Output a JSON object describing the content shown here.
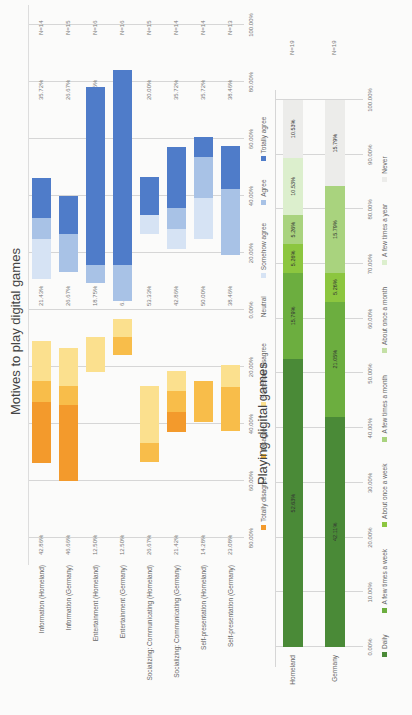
{
  "chart_data": [
    {
      "type": "bar",
      "subtype": "diverging-stacked-horizontal",
      "title": "Motives to play digital games",
      "categories": [
        "Information (Homeland)",
        "Information (Germany)",
        "Entertainment (Homeland)",
        "Entertainment (Germany)",
        "Socializing: Communicating (Homeland)",
        "Socializing: Communicating (Germany)",
        "Self-presentation (Homeland)",
        "Self-presentation (Germany)"
      ],
      "n": [
        "N=14",
        "N=15",
        "N=16",
        "N=16",
        "N=15",
        "N=14",
        "N=14",
        "N=13"
      ],
      "left_totals": [
        "42.86%",
        "46.66%",
        "12.50%",
        "12.50%",
        "26.67%",
        "21.42%",
        "14.28%",
        "23.08%"
      ],
      "neutral_values": [
        "21.43%",
        "26.67%",
        "18.75%",
        "6.25%",
        "53.33%",
        "42.86%",
        "50.00%",
        "38.46%"
      ],
      "right_totals": [
        "35.72%",
        "26.67%",
        "68.75%",
        "81.25%",
        "20.00%",
        "35.72%",
        "35.72%",
        "38.46%"
      ],
      "series": [
        {
          "name": "Totally disagree",
          "color": "#f39a2c",
          "values": [
            21.43,
            26.67,
            0,
            0,
            0,
            7.14,
            0,
            0
          ]
        },
        {
          "name": "Disagree",
          "color": "#f8bd4a",
          "values": [
            7.14,
            6.67,
            0,
            6.25,
            6.67,
            7.14,
            14.28,
            15.39
          ]
        },
        {
          "name": "Somehow disagree",
          "color": "#fbe08e",
          "values": [
            14.29,
            13.32,
            12.5,
            6.25,
            20.0,
            7.14,
            0,
            7.69
          ]
        },
        {
          "name": "Neutral",
          "color": "#fbfbfa",
          "values": [
            21.43,
            26.67,
            18.75,
            6.25,
            53.33,
            42.86,
            50.0,
            38.46
          ]
        },
        {
          "name": "Somehow agree",
          "color": "#d6e3f4",
          "values": [
            14.29,
            0,
            0,
            0,
            6.67,
            7.14,
            14.29,
            0
          ]
        },
        {
          "name": "Agree",
          "color": "#a8c2e6",
          "values": [
            7.14,
            13.34,
            6.25,
            12.5,
            0,
            7.14,
            14.29,
            23.08
          ]
        },
        {
          "name": "Totally agree",
          "color": "#4f7cc9",
          "values": [
            14.29,
            13.33,
            62.5,
            68.75,
            13.33,
            21.44,
            7.14,
            15.38
          ]
        }
      ],
      "xlabel": "",
      "x_ticks": [
        "80.00%",
        "60.00%",
        "40.00%",
        "20.00%",
        "0.00%",
        "20.00%",
        "40.00%",
        "60.00%",
        "80.00%",
        "100.00%"
      ],
      "xlim": [
        -80,
        100
      ],
      "grid": true,
      "legend_position": "bottom"
    },
    {
      "type": "bar",
      "subtype": "stacked-100-horizontal",
      "title": "Playing digital games",
      "categories": [
        "Homeland",
        "Germany"
      ],
      "n": [
        "N=19",
        "N=19"
      ],
      "series": [
        {
          "name": "Daily",
          "color": "#4a8a37",
          "values": [
            52.63,
            42.11
          ],
          "labels": [
            "52.63%",
            "42.11%"
          ]
        },
        {
          "name": "A few times a week",
          "color": "#6cae3f",
          "values": [
            15.79,
            21.05
          ],
          "labels": [
            "15.79%",
            "21.05%"
          ]
        },
        {
          "name": "About once a week",
          "color": "#8cc63f",
          "values": [
            5.26,
            5.26
          ],
          "labels": [
            "5.26%",
            "5.26%"
          ]
        },
        {
          "name": "A few times a month",
          "color": "#a9d37e",
          "values": [
            5.26,
            15.79
          ],
          "labels": [
            "5.26%",
            "15.79%"
          ]
        },
        {
          "name": "About once a month",
          "color": "#c4e0a5",
          "values": [
            0,
            0
          ],
          "labels": [
            "",
            ""
          ]
        },
        {
          "name": "A few times a year",
          "color": "#dcefcd",
          "values": [
            10.53,
            0
          ],
          "labels": [
            "10.53%",
            ""
          ]
        },
        {
          "name": "Never",
          "color": "#ececea",
          "values": [
            10.53,
            15.79
          ],
          "labels": [
            "10.53%",
            "15.79%"
          ]
        }
      ],
      "x_ticks": [
        "0.00%",
        "10.00%",
        "20.00%",
        "30.00%",
        "40.00%",
        "50.00%",
        "60.00%",
        "70.00%",
        "80.00%",
        "90.00%",
        "100.00%"
      ],
      "xlim": [
        0,
        100
      ],
      "grid": true,
      "legend_position": "bottom"
    }
  ]
}
